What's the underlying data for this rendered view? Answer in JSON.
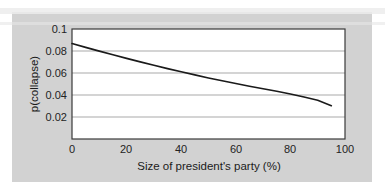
{
  "figure": {
    "background_color": "#d2d2d2",
    "plot_background_color": "#ffffff",
    "frame_color": "#3a3a3a",
    "gridline_color": "#a9a9a9",
    "curve_color": "#1a1a1a"
  },
  "chart_data": {
    "type": "line",
    "title": "",
    "xlabel": "Size of president's party (%)",
    "ylabel": "p(collapse)",
    "xlim": [
      0,
      100
    ],
    "ylim": [
      0,
      0.1
    ],
    "xticks": [
      0,
      20,
      40,
      60,
      80,
      100
    ],
    "xtick_labels": [
      "0",
      "20",
      "40",
      "60",
      "80",
      "100"
    ],
    "yticks": [
      0.02,
      0.04,
      0.06,
      0.08,
      0.1
    ],
    "ytick_labels": [
      "0.02",
      "0.04",
      "0.06",
      "0.08",
      "0.1"
    ],
    "grid": "horizontal",
    "legend": "none",
    "series": [
      {
        "name": "p(collapse)",
        "x": [
          0,
          5,
          10,
          15,
          20,
          25,
          30,
          35,
          40,
          45,
          50,
          55,
          60,
          65,
          70,
          75,
          80,
          85,
          90,
          95
        ],
        "values": [
          0.0868,
          0.0833,
          0.0799,
          0.0766,
          0.0733,
          0.0701,
          0.067,
          0.064,
          0.0611,
          0.0583,
          0.0555,
          0.0529,
          0.0504,
          0.048,
          0.0457,
          0.0434,
          0.0409,
          0.0381,
          0.0352,
          0.0303
        ]
      }
    ]
  }
}
